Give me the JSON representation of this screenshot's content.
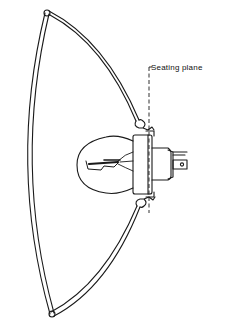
{
  "diagram": {
    "labels": {
      "seating_plane": "Seating plane"
    },
    "colors": {
      "line": "#1a1a1a",
      "background": "#ffffff"
    }
  }
}
